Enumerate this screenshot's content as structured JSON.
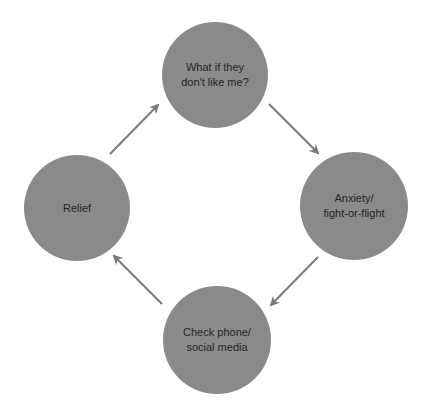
{
  "diagram": {
    "type": "cycle",
    "colors": {
      "background": "#ffffff",
      "node_fill": "#8a8a8a",
      "arrow": "#7a7a7a",
      "text": "#262626"
    },
    "nodes": [
      {
        "id": "what-if",
        "label": "What if they\ndon't like me?",
        "cx": 215,
        "cy": 75,
        "r": 53
      },
      {
        "id": "anxiety",
        "label": "Anxiety/\nfight-or-flight",
        "cx": 354,
        "cy": 206,
        "r": 54
      },
      {
        "id": "check-phone",
        "label": "Check phone/\nsocial media",
        "cx": 217,
        "cy": 340,
        "r": 54
      },
      {
        "id": "relief",
        "label": "Relief",
        "cx": 77,
        "cy": 208,
        "r": 53
      }
    ],
    "edges": [
      {
        "from": "what-if",
        "to": "anxiety",
        "x1": 269,
        "y1": 104,
        "x2": 318,
        "y2": 153
      },
      {
        "from": "anxiety",
        "to": "check-phone",
        "x1": 318,
        "y1": 257,
        "x2": 271,
        "y2": 305
      },
      {
        "from": "check-phone",
        "to": "relief",
        "x1": 162,
        "y1": 304,
        "x2": 114,
        "y2": 256
      },
      {
        "from": "relief",
        "to": "what-if",
        "x1": 110,
        "y1": 154,
        "x2": 158,
        "y2": 105
      }
    ]
  }
}
